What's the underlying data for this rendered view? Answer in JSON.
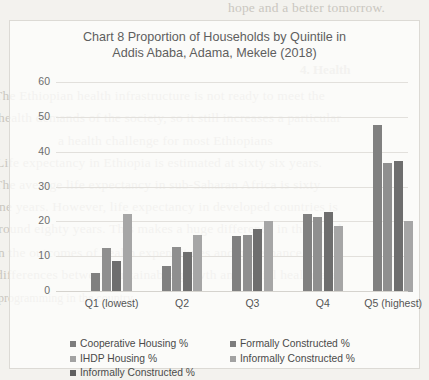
{
  "chart_data": {
    "type": "bar",
    "title": "Chart 8 Proportion of Households by Quintile in Addis Ababa, Adama, Mekele (2018)",
    "title_line1": "Chart 8 Proportion of Households by Quintile in",
    "title_line2": "Addis Ababa, Adama, Mekele (2018)",
    "xlabel": "",
    "ylabel": "",
    "ylim": [
      0,
      60
    ],
    "yticks": [
      0,
      10,
      20,
      30,
      40,
      50,
      60
    ],
    "grid": true,
    "legend_position": "bottom",
    "categories": [
      "Q1 (lowest)",
      "Q2",
      "Q3",
      "Q4",
      "Q5 (highest)"
    ],
    "series": [
      {
        "name": "Cooperative Housing %",
        "color": "#808080",
        "values": [
          5.5,
          7.5,
          16,
          22.5,
          48
        ]
      },
      {
        "name": "IHDP Housing %",
        "color": "#8f8f8f",
        "values": [
          12.5,
          13,
          16.5,
          21.5,
          37
        ]
      },
      {
        "name": "Informally Constructed %",
        "color": "#6e6e6e",
        "values": [
          9,
          11.5,
          18,
          23,
          37.5
        ]
      },
      {
        "name": "Formally  Constructed %",
        "color": "#a6a6a6",
        "values": [
          22.5,
          16.5,
          20.5,
          19,
          20.5
        ]
      }
    ],
    "legend_entries": [
      {
        "label": "Cooperative Housing %",
        "color": "#7d7d7d"
      },
      {
        "label": "Formally  Constructed %",
        "color": "#7d7d7d"
      },
      {
        "label": "IHDP Housing %",
        "color": "#a2a2a2"
      },
      {
        "label": "Informally Constructed %",
        "color": "#a2a2a2"
      },
      {
        "label": "Informally Constructed %",
        "color": "#5f5f5f"
      }
    ]
  },
  "bleed_text": {
    "l1": "hope and a better tomorrow.",
    "l2": "4. Health",
    "l3": "The Ethiopian health infrastructure is not ready to meet the",
    "l4": "health demands of the society, so it still increases a particular",
    "l5": "a health challenge for most Ethiopians",
    "l6": "Life expectancy in Ethiopia is estimated at sixty six years.",
    "l7": "The average life expectancy in sub-Saharan Africa is sixty",
    "l8": "one years. However, life expectancy in developed countries is",
    "l9": "around eighty years. This makes a huge difference in this rural",
    "l10": "in the outcomes of health expenditures and  governance",
    "l11": "differences between sustainable growth and social healthcare",
    "l12": "programming in the country."
  }
}
